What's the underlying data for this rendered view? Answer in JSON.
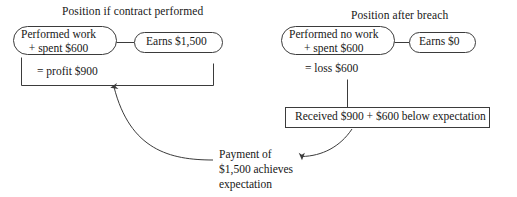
{
  "diagram": {
    "title_left": "Position if contract performed",
    "title_right": "Position after breach",
    "left_panel": {
      "node_main_line1": "Performed work",
      "node_main_line2": "+ spent $600",
      "node_side": "Earns $1,500",
      "bracket_total": "= profit $900"
    },
    "right_panel": {
      "node_main_line1": "Performed no work",
      "node_main_line2": "+ spent $600",
      "node_side": "Earns $0",
      "sum_total": "= loss $600",
      "result_box": "Received $900 + $600 below expectation"
    },
    "note": {
      "line1": "Payment of",
      "line2": "$1,500 achieves",
      "line3": "expectation"
    },
    "colors": {
      "stroke": "#3b3b3b",
      "text": "#171717",
      "background": "#ffffff"
    }
  }
}
